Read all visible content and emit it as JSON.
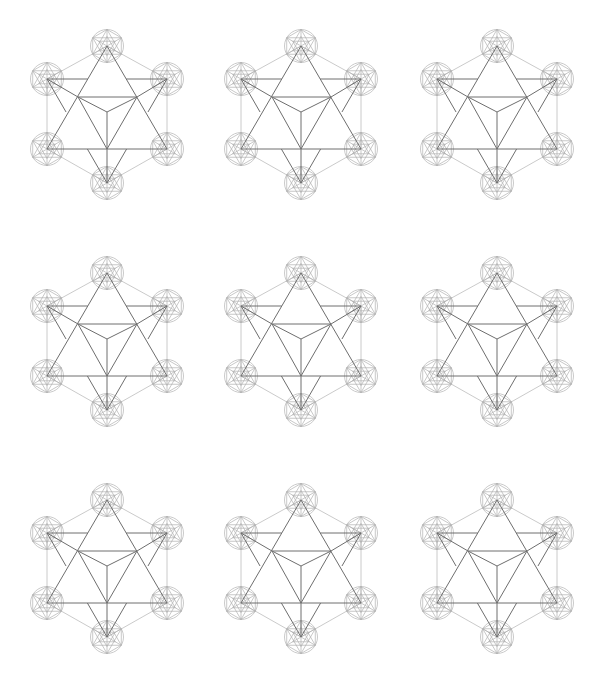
{
  "canvas": {
    "width": 592,
    "height": 689,
    "background": "#ffffff"
  },
  "grid": {
    "columns": [
      107,
      301,
      497
    ],
    "rows": [
      114,
      341,
      568
    ]
  },
  "figure": {
    "name": "star-tetrahedron-metatrons-cube",
    "count": 9,
    "outer_vertices": {
      "T": [
        0,
        -68
      ],
      "UL": [
        -60,
        -35
      ],
      "UR": [
        60,
        -35
      ],
      "LL": [
        -60,
        35
      ],
      "LR": [
        60,
        35
      ],
      "B": [
        0,
        69
      ]
    },
    "inner_points": {
      "IUL": [
        -29,
        -17
      ],
      "IUR": [
        30,
        -17
      ],
      "C": [
        0,
        -2
      ],
      "BC": [
        0,
        35
      ]
    },
    "node_circle_radius": 16.5,
    "colors": {
      "dark_lines": "#6e6e6e",
      "light_lines": "#c4c4c4",
      "node_pattern": "#b0b0b0"
    }
  }
}
